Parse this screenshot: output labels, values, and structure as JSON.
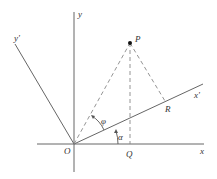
{
  "diagram": {
    "colors": {
      "line": "#666666",
      "dashed": "#888888",
      "text": "#333333",
      "point": "#111111"
    },
    "labels": {
      "y": "y",
      "x": "x",
      "y_prime": "y'",
      "x_prime": "x'",
      "origin": "O",
      "point_p": "P",
      "point_q": "Q",
      "point_r": "R",
      "angle_phi": "φ",
      "angle_alpha": "α"
    }
  }
}
